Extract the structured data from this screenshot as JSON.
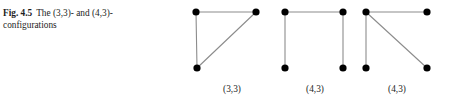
{
  "caption": {
    "figure_number": "Fig. 4.5",
    "text": "The (3,3)- and (4,3)-configurations"
  },
  "figure": {
    "node_color": "#000000",
    "edge_color": "#8c8c8c",
    "background_color": "#ffffff",
    "node_radius": 3.6,
    "edge_width": 1.1
  },
  "graphs": [
    {
      "label": "(3,3)",
      "name": "configuration-3-3",
      "nodes": [
        {
          "id": "a",
          "name": "node-top-left",
          "x": 196,
          "y": 12
        },
        {
          "id": "b",
          "name": "node-top-right",
          "x": 256,
          "y": 12
        },
        {
          "id": "c",
          "name": "node-bottom-left",
          "x": 197,
          "y": 68
        }
      ],
      "edges": [
        {
          "name": "edge-top",
          "from": "a",
          "to": "b"
        },
        {
          "name": "edge-left",
          "from": "a",
          "to": "c"
        },
        {
          "name": "edge-diagonal",
          "from": "b",
          "to": "c"
        }
      ]
    },
    {
      "label": "(4,3)",
      "name": "configuration-4-3-u-shape",
      "nodes": [
        {
          "id": "a",
          "name": "node-top-left",
          "x": 285,
          "y": 12
        },
        {
          "id": "b",
          "name": "node-top-right",
          "x": 343,
          "y": 12
        },
        {
          "id": "c",
          "name": "node-bottom-left",
          "x": 285,
          "y": 68
        },
        {
          "id": "d",
          "name": "node-bottom-right",
          "x": 343,
          "y": 68
        }
      ],
      "edges": [
        {
          "name": "edge-top",
          "from": "a",
          "to": "b"
        },
        {
          "name": "edge-left",
          "from": "a",
          "to": "c"
        },
        {
          "name": "edge-right",
          "from": "b",
          "to": "d"
        }
      ]
    },
    {
      "label": "(4,3)",
      "name": "configuration-4-3-star",
      "nodes": [
        {
          "id": "a",
          "name": "node-top-left",
          "x": 366,
          "y": 12
        },
        {
          "id": "b",
          "name": "node-top-right",
          "x": 427,
          "y": 12
        },
        {
          "id": "c",
          "name": "node-bottom-left",
          "x": 366,
          "y": 68
        },
        {
          "id": "d",
          "name": "node-bottom-right",
          "x": 427,
          "y": 68
        }
      ],
      "edges": [
        {
          "name": "edge-top",
          "from": "a",
          "to": "b"
        },
        {
          "name": "edge-left",
          "from": "a",
          "to": "c"
        },
        {
          "name": "edge-diagonal",
          "from": "a",
          "to": "d"
        }
      ]
    }
  ]
}
